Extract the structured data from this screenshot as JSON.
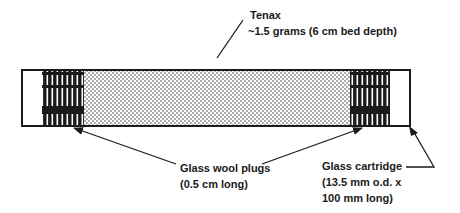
{
  "diagram": {
    "type": "cross-section",
    "labels": {
      "tenax": {
        "title": "Tenax",
        "detail": "~1.5 grams (6 cm bed depth)"
      },
      "glass_wool": {
        "title": "Glass wool plugs",
        "detail": "(0.5 cm long)"
      },
      "cartridge": {
        "title": "Glass cartridge",
        "detail_line1": "(13.5 mm o.d. x",
        "detail_line2": "100 mm long)"
      }
    },
    "regions": [
      {
        "name": "empty-left",
        "fill": "none"
      },
      {
        "name": "glass-wool-left",
        "fill": "vertical-fibers"
      },
      {
        "name": "tenax-bed",
        "fill": "dots"
      },
      {
        "name": "glass-wool-right",
        "fill": "vertical-fibers"
      },
      {
        "name": "empty-right",
        "fill": "none"
      }
    ],
    "colors": {
      "ink": "#1a1a1a",
      "background": "#ffffff"
    }
  }
}
